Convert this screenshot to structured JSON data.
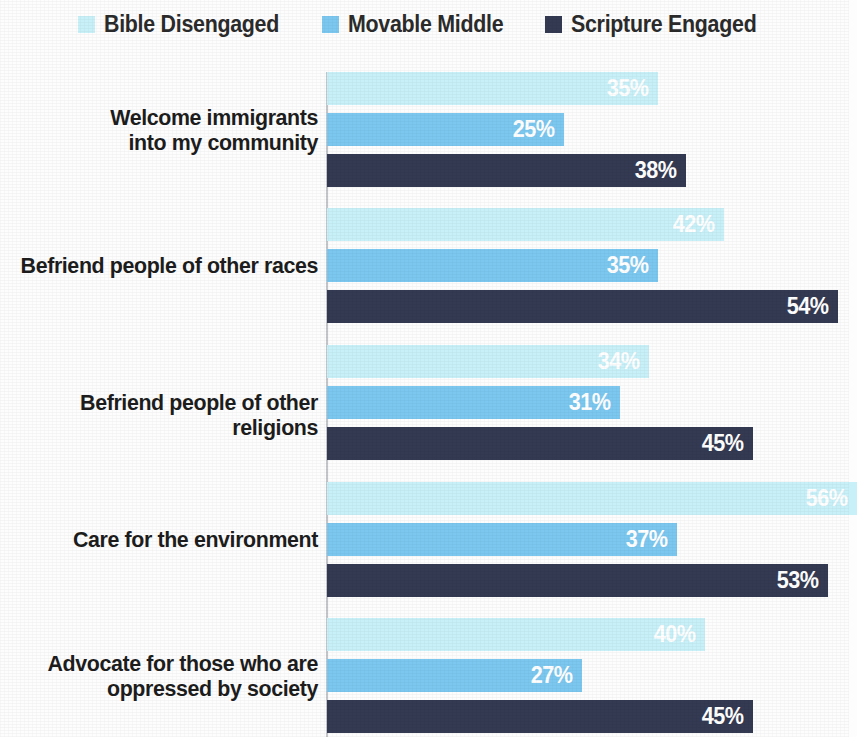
{
  "legend": {
    "position": "top-center",
    "entries": [
      {
        "label": "Bible Disengaged",
        "color": "#c8f0f8",
        "icon": "legend-swatch-icon"
      },
      {
        "label": "Movable Middle",
        "color": "#7cc7f0",
        "icon": "legend-swatch-icon"
      },
      {
        "label": "Scripture Engaged",
        "color": "#343a52",
        "icon": "legend-swatch-icon"
      }
    ]
  },
  "chart_data": {
    "type": "bar",
    "orientation": "horizontal",
    "title": "",
    "subtitle": "",
    "xlabel": "",
    "ylabel": "",
    "xlim": [
      0,
      56
    ],
    "grid": false,
    "legend_position": "top-center",
    "value_suffix": "%",
    "categories": [
      "Welcome immigrants into my community",
      "Befriend people of other races",
      "Befriend people of other religions",
      "Care for the environment",
      "Advocate for those who are oppressed by society"
    ],
    "series": [
      {
        "name": "Bible Disengaged",
        "color": "#c8f0f8",
        "values": [
          35,
          42,
          34,
          56,
          40
        ]
      },
      {
        "name": "Movable Middle",
        "color": "#7cc7f0",
        "values": [
          25,
          35,
          31,
          37,
          27
        ]
      },
      {
        "name": "Scripture Engaged",
        "color": "#343a52",
        "values": [
          38,
          54,
          45,
          53,
          45
        ]
      }
    ],
    "data_labels": [
      [
        "35%",
        "25%",
        "38%"
      ],
      [
        "42%",
        "35%",
        "54%"
      ],
      [
        "34%",
        "31%",
        "45%"
      ],
      [
        "56%",
        "37%",
        "53%"
      ],
      [
        "40%",
        "27%",
        "45%"
      ]
    ]
  },
  "category_label_lines": [
    [
      "Welcome immigrants",
      "into my community"
    ],
    [
      "Befriend people of other races"
    ],
    [
      "Befriend people of other religions"
    ],
    [
      "Care for the environment"
    ],
    [
      "Advocate for those who are",
      "oppressed by society"
    ]
  ],
  "axis": {
    "color": "#c2c6c9"
  }
}
